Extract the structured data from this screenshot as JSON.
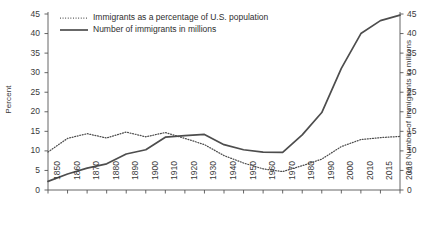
{
  "chart_data": {
    "type": "line",
    "title": "",
    "categories": [
      "1850",
      "1860",
      "1870",
      "1880",
      "1890",
      "1900",
      "1910",
      "1920",
      "1930",
      "1940",
      "1950",
      "1960",
      "1970",
      "1980",
      "1990",
      "2000",
      "2010",
      "2015",
      "2018"
    ],
    "xlabel": "",
    "series": [
      {
        "name": "Immigrants as a percentage of U.S. population",
        "style": "dotted",
        "axis": "left",
        "unit": "percent",
        "values": [
          9.7,
          13.2,
          14.4,
          13.3,
          14.8,
          13.6,
          14.7,
          13.2,
          11.6,
          8.8,
          6.9,
          5.4,
          4.7,
          6.2,
          7.9,
          11.1,
          12.9,
          13.4,
          13.7
        ]
      },
      {
        "name": "Number of immigrants in millions",
        "style": "solid",
        "axis": "right",
        "unit": "millions",
        "values": [
          2.2,
          4.1,
          5.6,
          6.7,
          9.2,
          10.3,
          13.5,
          13.9,
          14.2,
          11.6,
          10.3,
          9.7,
          9.6,
          14.1,
          19.8,
          31.1,
          40.0,
          43.3,
          44.7
        ]
      }
    ],
    "ylabel": "Percent",
    "ylim": [
      0,
      45
    ],
    "yticks": [
      "0",
      "5",
      "10",
      "15",
      "20",
      "25",
      "30",
      "35",
      "40",
      "45"
    ],
    "y2label": "Number of immigrants in millions",
    "y2lim": [
      0,
      45
    ],
    "y2ticks": [
      "0",
      "5",
      "10",
      "15",
      "20",
      "25",
      "30",
      "35",
      "40",
      "45"
    ],
    "grid": false,
    "legend_position": "top-left"
  },
  "legend": {
    "entries": [
      {
        "label": "Immigrants as a percentage of U.S. population",
        "style": "dotted"
      },
      {
        "label": "Number of immigrants in millions",
        "style": "solid"
      }
    ]
  },
  "colors": {
    "line": "#4d4d4d",
    "axis": "#555555",
    "text": "#3a3a3a",
    "background": "#ffffff"
  }
}
